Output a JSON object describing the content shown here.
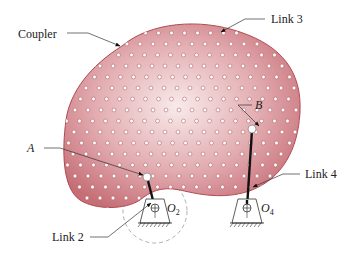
{
  "figure": {
    "type": "fourbar-linkage-diagram",
    "colors": {
      "coupler_fill_center": "#f7e6e6",
      "coupler_fill_edge": "#c9737a",
      "coupler_outline": "#b24a52",
      "dot_fill": "#ffffff",
      "dot_stroke": "#a65058",
      "link_color": "#111111",
      "leader_color": "#333333",
      "dashed_circle": "#999999"
    },
    "labels": {
      "coupler": "Coupler",
      "link3": "Link 3",
      "point_b": "B",
      "point_a": "A",
      "link4": "Link 4",
      "link2": "Link 2",
      "o2_main": "O",
      "o2_sub": "2",
      "o4_main": "O",
      "o4_sub": "4"
    },
    "points": {
      "A": [
        147,
        177
      ],
      "B": [
        252,
        129
      ],
      "O2": [
        155,
        208
      ],
      "O4": [
        247,
        208
      ]
    }
  }
}
